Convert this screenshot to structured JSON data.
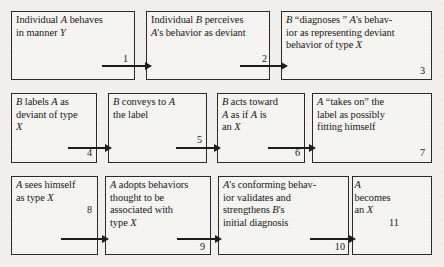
{
  "diagram": {
    "type": "flowchart",
    "rows": [
      {
        "boxes": [
          {
            "number": "1",
            "lines": [
              "Individual A behaves",
              "in manner Y"
            ],
            "italics": [
              "A",
              "Y"
            ]
          },
          {
            "number": "2",
            "lines": [
              "Individual B perceives",
              "A's behavior as deviant"
            ],
            "italics": [
              "B",
              "A"
            ]
          },
          {
            "number": "3",
            "lines": [
              "B “diagnoses ” A's behav-",
              "ior as representing deviant",
              "behavior of type X"
            ],
            "italics": [
              "B",
              "A",
              "X"
            ]
          }
        ]
      },
      {
        "boxes": [
          {
            "number": "4",
            "lines": [
              "B labels A as",
              "deviant of type",
              "X"
            ],
            "italics": [
              "B",
              "A",
              "X"
            ]
          },
          {
            "number": "5",
            "lines": [
              "B conveys to A",
              "the label"
            ],
            "italics": [
              "B",
              "A"
            ]
          },
          {
            "number": "6",
            "lines": [
              "B acts toward",
              "A as if A is",
              "an X"
            ],
            "italics": [
              "B",
              "A",
              "X"
            ]
          },
          {
            "number": "7",
            "lines": [
              "A “takes on” the",
              "label as possibly",
              "fitting himself"
            ],
            "italics": [
              "A"
            ]
          }
        ]
      },
      {
        "boxes": [
          {
            "number": "8",
            "lines": [
              "A sees himself",
              "as type X"
            ],
            "italics": [
              "A",
              "X"
            ]
          },
          {
            "number": "9",
            "lines": [
              "A adopts behaviors",
              "thought to be",
              "associated with",
              "type X"
            ],
            "italics": [
              "A",
              "X"
            ]
          },
          {
            "number": "10",
            "lines": [
              "A's conforming behav-",
              "ior validates and",
              "strengthens B's",
              "initial diagnosis"
            ],
            "italics": [
              "A",
              "B"
            ]
          },
          {
            "number": "11",
            "lines": [
              "A",
              "becomes",
              "an X"
            ],
            "italics": [
              "A",
              "X"
            ]
          }
        ]
      }
    ],
    "arrow_labels": [
      "1",
      "2",
      "4",
      "5",
      "6",
      "8",
      "9",
      "10"
    ],
    "colors": {
      "ink": "#181818",
      "border": "#2b2b2b",
      "page": "#f2f1ee",
      "box_fill": "#f6f5f2"
    }
  }
}
